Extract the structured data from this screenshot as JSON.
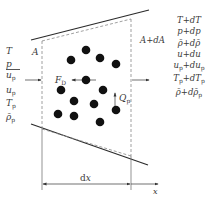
{
  "diagram": {
    "type": "control-volume-schematic",
    "left_area_label": "A",
    "right_area_label": "A+dA",
    "drag_force_label": "F",
    "drag_force_sub": "D",
    "heat_label": "Q",
    "heat_sub": "p",
    "width_label": "dx",
    "axis_label": "x",
    "left_state": [
      {
        "base": "T",
        "sub": ""
      },
      {
        "base": "p",
        "sub": ""
      },
      {
        "base": "u",
        "sub": "p"
      },
      {
        "base": "u",
        "sub": "p"
      },
      {
        "base": "T",
        "sub": "p"
      },
      {
        "base": "ρ̄",
        "sub": "p"
      }
    ],
    "right_state": [
      "T+dT",
      "p+dp",
      "ρ̄+dρ̄",
      "u+du",
      "u_p+du_p",
      "T_p+dT_p",
      "ρ̄+dρ̄_p"
    ],
    "particles": [
      {
        "cx": 71,
        "cy": 60
      },
      {
        "cx": 86,
        "cy": 50
      },
      {
        "cx": 100,
        "cy": 58
      },
      {
        "cx": 116,
        "cy": 64
      },
      {
        "cx": 86,
        "cy": 80
      },
      {
        "cx": 61,
        "cy": 90
      },
      {
        "cx": 103,
        "cy": 90
      },
      {
        "cx": 74,
        "cy": 101
      },
      {
        "cx": 94,
        "cy": 104
      },
      {
        "cx": 116,
        "cy": 110
      },
      {
        "cx": 58,
        "cy": 114
      },
      {
        "cx": 74,
        "cy": 116
      },
      {
        "cx": 100,
        "cy": 122
      }
    ],
    "colors": {
      "line": "#2b2b2b",
      "dashed": "#777777",
      "particle": "#111111"
    }
  }
}
